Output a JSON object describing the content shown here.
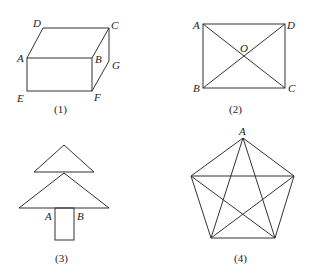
{
  "figures": [
    {
      "caption": "(1)",
      "type": "rectangular-prism",
      "labels": {
        "A": "A",
        "B": "B",
        "C": "C",
        "D": "D",
        "E": "E",
        "F": "F",
        "G": "G"
      }
    },
    {
      "caption": "(2)",
      "type": "rectangle-with-diagonals",
      "labels": {
        "A": "A",
        "B": "B",
        "C": "C",
        "D": "D",
        "O": "O"
      }
    },
    {
      "caption": "(3)",
      "type": "tree-shape",
      "labels": {
        "A": "A",
        "B": "B"
      }
    },
    {
      "caption": "(4)",
      "type": "pentagon-with-star",
      "labels": {
        "A": "A"
      }
    }
  ]
}
